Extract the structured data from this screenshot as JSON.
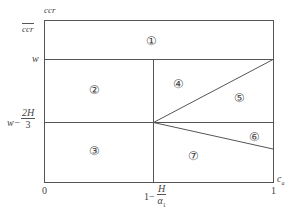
{
  "diagram": {
    "y_axis": {
      "label_top": "ccr",
      "label_side": "ccr",
      "ticks": [
        {
          "label": "w"
        },
        {
          "label_prefix": "w−",
          "frac_num": "2H",
          "frac_den": "3"
        }
      ]
    },
    "x_axis": {
      "label": "c",
      "label_sub": "a",
      "ticks": [
        {
          "label": "0"
        },
        {
          "label_prefix": "1−",
          "frac_num": "H",
          "frac_den": "α",
          "frac_den_sub": "1"
        },
        {
          "label": "1"
        }
      ]
    },
    "regions": [
      {
        "id": "1",
        "label": "①"
      },
      {
        "id": "2",
        "label": "②"
      },
      {
        "id": "3",
        "label": "③"
      },
      {
        "id": "4",
        "label": "④"
      },
      {
        "id": "5",
        "label": "⑤"
      },
      {
        "id": "6",
        "label": "⑥"
      },
      {
        "id": "7",
        "label": "⑦"
      }
    ],
    "line_color": "#555555"
  }
}
